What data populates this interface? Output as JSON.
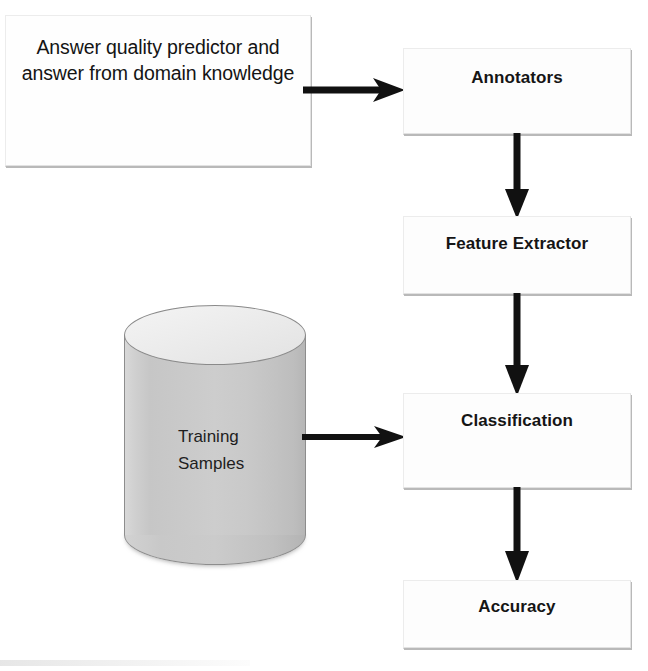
{
  "diagram": {
    "type": "flowchart",
    "background_color": "#ffffff",
    "nodes": [
      {
        "id": "input",
        "label": "Answer quality predictor and answer from domain knowledge",
        "shape": "rectangle",
        "bold": false
      },
      {
        "id": "annotators",
        "label": "Annotators",
        "shape": "rectangle",
        "bold": true
      },
      {
        "id": "feature_extractor",
        "label": "Feature Extractor",
        "shape": "rectangle",
        "bold": true
      },
      {
        "id": "training_samples",
        "label": "Training\nSamples",
        "shape": "cylinder",
        "bold": false
      },
      {
        "id": "classification",
        "label": "Classification",
        "shape": "rectangle",
        "bold": true
      },
      {
        "id": "accuracy",
        "label": "Accuracy",
        "shape": "rectangle",
        "bold": true
      }
    ],
    "edges": [
      {
        "from": "input",
        "to": "annotators",
        "direction": "right"
      },
      {
        "from": "annotators",
        "to": "feature_extractor",
        "direction": "down"
      },
      {
        "from": "feature_extractor",
        "to": "classification",
        "direction": "down"
      },
      {
        "from": "training_samples",
        "to": "classification",
        "direction": "right"
      },
      {
        "from": "classification",
        "to": "accuracy",
        "direction": "down"
      }
    ],
    "colors": {
      "arrow": "#111111",
      "box_fill": "#fdfdfd",
      "box_border": "#e2e2e2",
      "box_shadow": "#b9b9b9",
      "cylinder_fill": "#c9c9c9",
      "text": "#151515"
    }
  }
}
